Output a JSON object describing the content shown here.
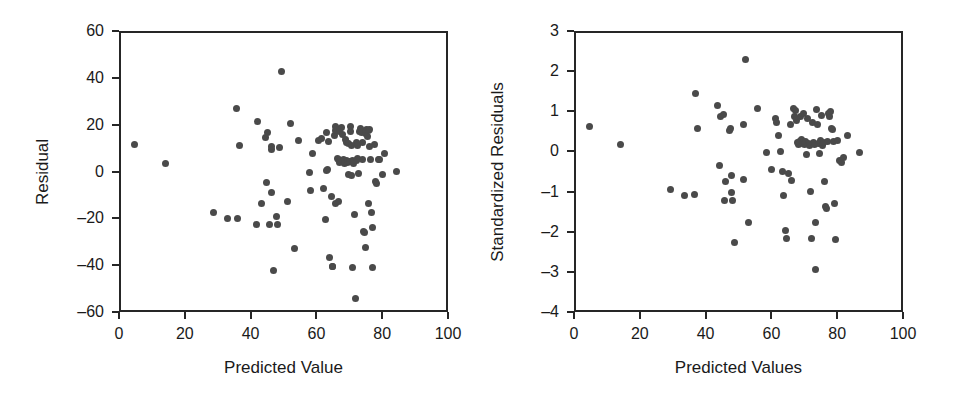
{
  "figure": {
    "width": 956,
    "height": 402,
    "background": "#ffffff",
    "point_color": "#4a4a4a",
    "axis_color": "#262626"
  },
  "chart_data": [
    {
      "type": "scatter",
      "id": "residual-vs-predicted",
      "title": "",
      "xlabel": "Predicted Value",
      "ylabel": "Residual",
      "xlim": [
        0,
        100
      ],
      "ylim": [
        -60,
        60
      ],
      "xticks": [
        0,
        20,
        40,
        60,
        80,
        100
      ],
      "yticks": [
        60,
        40,
        20,
        0,
        -20,
        -40,
        -60
      ],
      "xticklabels": [
        "0",
        "20",
        "40",
        "60",
        "80",
        "100"
      ],
      "yticklabels": [
        "60",
        "40",
        "20",
        "0",
        "–20",
        "–40",
        "–60"
      ],
      "grid": false,
      "legend": null,
      "marker": "circle",
      "n_points": 96,
      "points": [
        [
          4.2,
          12.5
        ],
        [
          13.5,
          4.4
        ],
        [
          28.0,
          -16.8
        ],
        [
          32.4,
          -19.3
        ],
        [
          35.5,
          -19.2
        ],
        [
          35.2,
          27.8
        ],
        [
          35.9,
          11.9
        ],
        [
          41.6,
          22.3
        ],
        [
          41.1,
          -21.9
        ],
        [
          42.6,
          -12.7
        ],
        [
          44.4,
          17.4
        ],
        [
          44.0,
          15.5
        ],
        [
          44.3,
          -3.9
        ],
        [
          45.6,
          10.2
        ],
        [
          45.8,
          11.6
        ],
        [
          45.6,
          -8.1
        ],
        [
          45.2,
          -21.8
        ],
        [
          46.4,
          -41.4
        ],
        [
          47.3,
          -18.4
        ],
        [
          47.6,
          -21.7
        ],
        [
          48.9,
          43.7
        ],
        [
          48.2,
          11.0
        ],
        [
          50.7,
          -12.0
        ],
        [
          51.5,
          21.2
        ],
        [
          52.7,
          -32.0
        ],
        [
          54.1,
          13.9
        ],
        [
          57.2,
          0.4
        ],
        [
          57.6,
          -7.1
        ],
        [
          58.3,
          8.4
        ],
        [
          60.0,
          14.3
        ],
        [
          60.8,
          14.8
        ],
        [
          61.4,
          -6.5
        ],
        [
          62.1,
          -19.6
        ],
        [
          62.4,
          17.4
        ],
        [
          62.8,
          1.5
        ],
        [
          62.6,
          1.1
        ],
        [
          63.2,
          13.5
        ],
        [
          63.4,
          -35.8
        ],
        [
          63.9,
          -9.9
        ],
        [
          64.4,
          -39.6
        ],
        [
          64.2,
          -39.9
        ],
        [
          64.9,
          16.2
        ],
        [
          65.1,
          20.2
        ],
        [
          65.4,
          18.9
        ],
        [
          65.2,
          18.5
        ],
        [
          65.7,
          6.3
        ],
        [
          65.3,
          -12.6
        ],
        [
          66.1,
          -12.0
        ],
        [
          66.5,
          17.9
        ],
        [
          66.2,
          5.9
        ],
        [
          66.8,
          5.2
        ],
        [
          66.4,
          4.7
        ],
        [
          67.1,
          19.5
        ],
        [
          67.3,
          16.7
        ],
        [
          67.6,
          6.1
        ],
        [
          67.9,
          4.4
        ],
        [
          68.2,
          14.6
        ],
        [
          68.6,
          13.4
        ],
        [
          68.4,
          5.5
        ],
        [
          68.8,
          4.9
        ],
        [
          69.1,
          12.9
        ],
        [
          69.4,
          5.1
        ],
        [
          69.2,
          -0.5
        ],
        [
          69.7,
          20.0
        ],
        [
          69.9,
          17.8
        ],
        [
          70.1,
          11.8
        ],
        [
          70.3,
          5.7
        ],
        [
          70.6,
          4.2
        ],
        [
          70.2,
          -1.0
        ],
        [
          70.9,
          -17.6
        ],
        [
          70.4,
          -40.1
        ],
        [
          71.2,
          -53.4
        ],
        [
          71.5,
          13.1
        ],
        [
          71.8,
          11.9
        ],
        [
          72.0,
          6.4
        ],
        [
          71.6,
          5.6
        ],
        [
          72.4,
          18.0
        ],
        [
          72.7,
          19.4
        ],
        [
          72.3,
          -0.2
        ],
        [
          73.1,
          17.6
        ],
        [
          73.5,
          13.2
        ],
        [
          73.4,
          5.8
        ],
        [
          73.8,
          -24.6
        ],
        [
          74.1,
          -25.1
        ],
        [
          74.3,
          17.1
        ],
        [
          74.6,
          18.8
        ],
        [
          74.2,
          -31.8
        ],
        [
          75.0,
          16.0
        ],
        [
          75.3,
          18.2
        ],
        [
          75.6,
          19.0
        ],
        [
          75.4,
          11.7
        ],
        [
          75.8,
          5.9
        ],
        [
          75.2,
          -12.8
        ],
        [
          76.1,
          -16.8
        ],
        [
          76.5,
          -23.0
        ],
        [
          76.3,
          -40.2
        ],
        [
          77.0,
          12.2
        ],
        [
          77.4,
          -3.6
        ],
        [
          77.7,
          -4.3
        ],
        [
          78.2,
          5.8
        ],
        [
          78.6,
          6.0
        ],
        [
          79.4,
          -0.4
        ],
        [
          80.1,
          8.5
        ],
        [
          83.8,
          0.9
        ]
      ]
    },
    {
      "type": "scatter",
      "id": "standardized-residual-vs-predicted",
      "title": "",
      "xlabel": "Predicted Values",
      "ylabel": "Standardized Residuals",
      "xlim": [
        0,
        100
      ],
      "ylim": [
        -4,
        3
      ],
      "xticks": [
        0,
        20,
        40,
        60,
        80,
        100
      ],
      "yticks": [
        3,
        2,
        1,
        0,
        -1,
        -2,
        -3,
        -4
      ],
      "xticklabels": [
        "0",
        "20",
        "40",
        "60",
        "80",
        "100"
      ],
      "yticklabels": [
        "3",
        "2",
        "1",
        "0",
        "–1",
        "–2",
        "–3",
        "–4"
      ],
      "grid": false,
      "legend": null,
      "marker": "circle",
      "n_points": 96,
      "points": [
        [
          4.2,
          0.66
        ],
        [
          13.6,
          0.22
        ],
        [
          28.8,
          -0.9
        ],
        [
          32.9,
          -1.04
        ],
        [
          36.0,
          -1.03
        ],
        [
          36.3,
          1.49
        ],
        [
          36.9,
          0.63
        ],
        [
          42.9,
          1.19
        ],
        [
          44.0,
          0.91
        ],
        [
          43.6,
          -0.29
        ],
        [
          44.9,
          0.96
        ],
        [
          45.3,
          -0.69
        ],
        [
          45.2,
          -1.17
        ],
        [
          46.9,
          0.62
        ],
        [
          46.6,
          0.58
        ],
        [
          47.2,
          -0.55
        ],
        [
          47.3,
          -0.98
        ],
        [
          47.6,
          -1.18
        ],
        [
          48.3,
          -2.22
        ],
        [
          51.4,
          2.34
        ],
        [
          50.8,
          0.73
        ],
        [
          50.9,
          -0.66
        ],
        [
          52.5,
          -1.71
        ],
        [
          55.3,
          1.13
        ],
        [
          57.9,
          0.03
        ],
        [
          59.3,
          -0.41
        ],
        [
          60.5,
          0.88
        ],
        [
          61.0,
          0.77
        ],
        [
          61.6,
          0.45
        ],
        [
          62.2,
          0.06
        ],
        [
          62.9,
          -0.44
        ],
        [
          63.2,
          -1.05
        ],
        [
          63.7,
          -1.93
        ],
        [
          64.0,
          -2.12
        ],
        [
          64.6,
          -0.5
        ],
        [
          65.2,
          0.71
        ],
        [
          65.6,
          -0.67
        ],
        [
          66.0,
          1.12
        ],
        [
          66.3,
          0.93
        ],
        [
          66.6,
          1.06
        ],
        [
          66.9,
          0.83
        ],
        [
          67.2,
          0.26
        ],
        [
          67.5,
          0.22
        ],
        [
          67.8,
          0.3
        ],
        [
          68.1,
          0.91
        ],
        [
          68.4,
          0.35
        ],
        [
          68.7,
          0.25
        ],
        [
          69.0,
          1.0
        ],
        [
          69.3,
          0.27
        ],
        [
          69.6,
          0.21
        ],
        [
          69.9,
          0.3
        ],
        [
          70.2,
          -0.02
        ],
        [
          70.5,
          0.86
        ],
        [
          70.8,
          0.24
        ],
        [
          71.1,
          0.2
        ],
        [
          71.4,
          -0.96
        ],
        [
          71.6,
          -2.13
        ],
        [
          71.9,
          0.78
        ],
        [
          72.2,
          0.28
        ],
        [
          72.5,
          0.22
        ],
        [
          72.8,
          -1.71
        ],
        [
          72.9,
          -2.88
        ],
        [
          73.2,
          1.09
        ],
        [
          73.5,
          0.72
        ],
        [
          73.8,
          0.25
        ],
        [
          74.1,
          -0.01
        ],
        [
          74.4,
          0.31
        ],
        [
          74.7,
          0.95
        ],
        [
          75.0,
          0.19
        ],
        [
          75.3,
          0.28
        ],
        [
          75.6,
          -0.71
        ],
        [
          75.9,
          -1.33
        ],
        [
          76.2,
          -1.36
        ],
        [
          76.5,
          0.3
        ],
        [
          76.8,
          1.0
        ],
        [
          77.1,
          0.93
        ],
        [
          77.4,
          1.04
        ],
        [
          77.7,
          0.63
        ],
        [
          78.0,
          0.6
        ],
        [
          78.3,
          0.29
        ],
        [
          78.6,
          -1.24
        ],
        [
          78.9,
          -2.15
        ],
        [
          79.6,
          0.31
        ],
        [
          80.2,
          -0.18
        ],
        [
          80.6,
          -0.23
        ],
        [
          81.3,
          -0.1
        ],
        [
          82.4,
          0.44
        ],
        [
          86.3,
          0.03
        ]
      ]
    }
  ]
}
